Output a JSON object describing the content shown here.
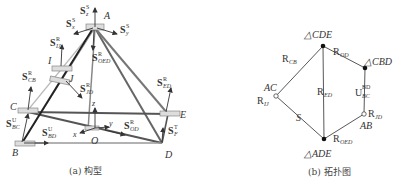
{
  "figure_a": {
    "caption": "(a) 构型",
    "points": {
      "A": "A",
      "I": "I",
      "J": "J",
      "C": "C",
      "E": "E",
      "B": "B",
      "D": "D",
      "O": "O"
    },
    "axes": {
      "x": "x",
      "y": "y",
      "z": "z"
    },
    "screw_labels": [
      {
        "id": "S_z^S",
        "base": "S",
        "sup": "S",
        "sub": "z"
      },
      {
        "id": "S_x^S",
        "base": "S",
        "sup": "S",
        "sub": "x"
      },
      {
        "id": "S_y^S",
        "base": "S",
        "sup": "S",
        "sub": "y"
      },
      {
        "id": "S_IJ^R",
        "base": "S",
        "sup": "R",
        "sub": "IJ"
      },
      {
        "id": "S_OED^R",
        "base": "S",
        "sup": "R",
        "sub": "OED"
      },
      {
        "id": "S_CB^R",
        "base": "S",
        "sup": "R",
        "sub": "CB"
      },
      {
        "id": "S_JD^R",
        "base": "S",
        "sup": "R",
        "sub": "JD"
      },
      {
        "id": "S_ED^R",
        "base": "S",
        "sup": "R",
        "sub": "ED"
      },
      {
        "id": "S_BC^U",
        "base": "S",
        "sup": "U",
        "sub": "BC"
      },
      {
        "id": "S_BD^U",
        "base": "S",
        "sup": "U",
        "sub": "BD"
      },
      {
        "id": "S_OD^R",
        "base": "S",
        "sup": "R",
        "sub": "OD"
      },
      {
        "id": "S_F^T",
        "base": "S",
        "sup": "T",
        "sub": "F"
      }
    ]
  },
  "figure_b": {
    "caption": "(b) 拓扑图",
    "nodes": [
      {
        "id": "CDE",
        "label": "△CDE",
        "type": "filled"
      },
      {
        "id": "CBD",
        "label": "△CBD",
        "type": "filled"
      },
      {
        "id": "AC",
        "label": "AC",
        "type": "open"
      },
      {
        "id": "AB",
        "label": "AB",
        "type": "open"
      },
      {
        "id": "ADE",
        "label": "△ADE",
        "type": "filled"
      }
    ],
    "edges": [
      {
        "from": "CDE",
        "to": "AC",
        "base": "R",
        "sub": "CB"
      },
      {
        "from": "CDE",
        "to": "CBD",
        "base": "R",
        "sub": "OD"
      },
      {
        "from": "CDE",
        "to": "ADE",
        "base": "R",
        "sub": "ED"
      },
      {
        "from": "CBD",
        "to": "AB",
        "base": "U",
        "sup": "BD",
        "sub": "BC"
      },
      {
        "from": "AC",
        "to": "ADE",
        "base": "S",
        "sub": ""
      },
      {
        "from": "AB",
        "to": "ADE",
        "base": "R",
        "sub": "OED"
      }
    ],
    "node_annotations": [
      {
        "node": "AC",
        "base": "R",
        "sub": "IJ"
      },
      {
        "node": "AB",
        "base": "R",
        "sub": "JD"
      }
    ]
  }
}
